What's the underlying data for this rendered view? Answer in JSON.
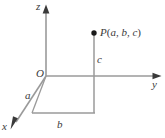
{
  "figure": {
    "type": "diagram",
    "title": "",
    "background_color": "#ffffff",
    "line_color": "#8c8c8c",
    "text_color": "#3a3a3a",
    "point_color": "#1a1a1a",
    "width": 165,
    "height": 138,
    "axes": [
      {
        "name": "z-axis",
        "label": "z",
        "direction": "up",
        "from": [
          46,
          76
        ],
        "to": [
          46,
          8
        ],
        "arrow": true
      },
      {
        "name": "y-axis",
        "label": "y",
        "direction": "right",
        "from": [
          46,
          76
        ],
        "to": [
          160,
          76
        ],
        "arrow": true
      },
      {
        "name": "x-axis",
        "label": "x",
        "direction": "down-left",
        "from": [
          46,
          76
        ],
        "to": [
          11,
          129
        ],
        "arrow": true
      }
    ],
    "origin": {
      "name": "origin",
      "label": "O",
      "position": [
        46,
        76
      ]
    },
    "point": {
      "name": "point-P",
      "label": "P(a, b, c)",
      "label_parts": {
        "letter": "P",
        "open": "(",
        "x": "a",
        "comma1": ", ",
        "y": "b",
        "comma2": ", ",
        "z": "c",
        "close": ")"
      },
      "marker_position": [
        94,
        33
      ],
      "marker_radius": 2.6
    },
    "segments": [
      {
        "name": "drop-line-P-to-plane",
        "from": [
          94,
          33
        ],
        "to": [
          94,
          113
        ],
        "meaning": "vertical line from P down to xy-plane"
      },
      {
        "name": "projection-edge-right",
        "from": [
          94,
          76
        ],
        "to": [
          94,
          113
        ],
        "meaning": "segment below y-axis"
      },
      {
        "name": "projection-edge-bottom",
        "from": [
          32,
          113
        ],
        "to": [
          94,
          113
        ],
        "meaning": "edge of length b in the xy-plane"
      },
      {
        "name": "projection-edge-left",
        "from": [
          32,
          113
        ],
        "to": [
          46,
          76
        ],
        "meaning": "edge of length a along the x direction"
      }
    ],
    "dimension_labels": [
      {
        "name": "label-a",
        "text": "a",
        "position": [
          25,
          90
        ],
        "measures": "x-coordinate"
      },
      {
        "name": "label-b",
        "text": "b",
        "position": [
          57,
          119
        ],
        "measures": "y-coordinate"
      },
      {
        "name": "label-c",
        "text": "c",
        "position": [
          97,
          54
        ],
        "measures": "z-coordinate"
      }
    ],
    "axis_labels": [
      {
        "name": "label-z",
        "text": "z",
        "position": [
          36,
          1
        ]
      },
      {
        "name": "label-y",
        "text": "y",
        "position": [
          152,
          79
        ]
      },
      {
        "name": "label-x",
        "text": "x",
        "position": [
          2,
          121
        ]
      }
    ]
  }
}
